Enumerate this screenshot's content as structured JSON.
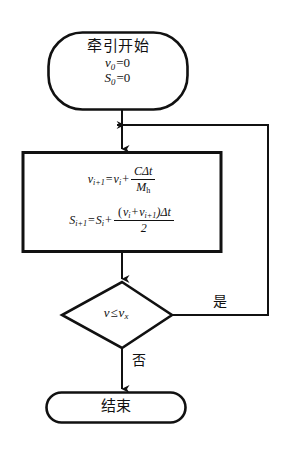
{
  "diagram": {
    "type": "flowchart",
    "orientation": "vertical",
    "background_color": "#ffffff",
    "line_color": "#111111"
  },
  "nodes": {
    "start": {
      "shape": "terminator",
      "title": "牵引开始",
      "initial_velocity": "v",
      "initial_velocity_sub": "0",
      "initial_velocity_value": "=0",
      "initial_distance": "S",
      "initial_distance_sub": "0",
      "initial_distance_value": "=0"
    },
    "process": {
      "shape": "rectangle",
      "formula_velocity": {
        "lhs_var": "v",
        "lhs_sub": "i+1",
        "equals": "=",
        "term_var": "v",
        "term_sub": "i",
        "plus": "+",
        "numerator": "CΔt",
        "denominator_var": "M",
        "denominator_sub": "h"
      },
      "formula_distance": {
        "lhs_var": "S",
        "lhs_sub": "i+1",
        "equals": "=",
        "term_var": "S",
        "term_sub": "i",
        "plus": "+",
        "numerator_open": "(",
        "numerator_v1": "v",
        "numerator_v1_sub": "i",
        "numerator_plus": "+",
        "numerator_v2": "v",
        "numerator_v2_sub": "i+1",
        "numerator_close": ")Δt",
        "denominator": "2"
      }
    },
    "decision": {
      "shape": "diamond",
      "condition_lhs": "v",
      "condition_op": "≤",
      "condition_rhs": "v",
      "condition_rhs_sub": "x"
    },
    "end": {
      "shape": "terminator",
      "title": "结束"
    }
  },
  "edges": {
    "yes_label": "是",
    "no_label": "否",
    "start_to_process": "arrow-down",
    "process_to_decision": "arrow-down",
    "decision_to_end": "arrow-down",
    "loop_back": "arrow-left"
  }
}
